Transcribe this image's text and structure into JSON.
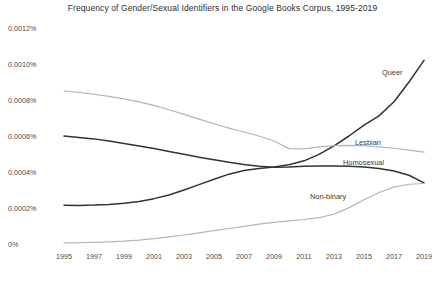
{
  "chart_data": {
    "type": "line",
    "title": "Frequency of Gender/Sexual Identifiers in the Google Books Corpus, 1995-2019",
    "xlabel": "",
    "ylabel": "",
    "grid": false,
    "legend_position": "inline-right",
    "x": [
      1995,
      1996,
      1997,
      1998,
      1999,
      2000,
      2001,
      2002,
      2003,
      2004,
      2005,
      2006,
      2007,
      2008,
      2009,
      2010,
      2011,
      2012,
      2013,
      2014,
      2015,
      2016,
      2017,
      2018,
      2019
    ],
    "xticks": [
      "1995",
      "1997",
      "1999",
      "2001",
      "2003",
      "2005",
      "2007",
      "2009",
      "2011",
      "2013",
      "2015",
      "2017",
      "2019"
    ],
    "xtick_values": [
      1995,
      1997,
      1999,
      2001,
      2003,
      2005,
      2007,
      2009,
      2011,
      2013,
      2015,
      2017,
      2019
    ],
    "yticks": [
      "0%",
      "0.0002%",
      "0.0004%",
      "0.0006%",
      "0.0008%",
      "0.0010%",
      "0.0012%"
    ],
    "ytick_values": [
      0,
      0.0002,
      0.0004,
      0.0006,
      0.0008,
      0.001,
      0.0012
    ],
    "ylim": [
      0,
      0.0012
    ],
    "xlim": [
      1995,
      2019
    ],
    "series": [
      {
        "name": "Queer",
        "color": "#333333",
        "width": 1.5,
        "label_x": 2016.2,
        "label_y": 0.00094,
        "values": [
          0.000215,
          0.000214,
          0.000216,
          0.00022,
          0.000226,
          0.000236,
          0.000252,
          0.000272,
          0.0003,
          0.00033,
          0.00036,
          0.000388,
          0.000408,
          0.00042,
          0.000428,
          0.00044,
          0.000462,
          0.000498,
          0.000545,
          0.0006,
          0.00066,
          0.000712,
          0.00079,
          0.0009,
          0.00102
        ]
      },
      {
        "name": "Lesbian",
        "color": "#b5b5b5",
        "width": 1.2,
        "label_x": 2014.4,
        "label_y": 0.000548,
        "values": [
          0.00085,
          0.000842,
          0.000832,
          0.00082,
          0.000806,
          0.00079,
          0.00077,
          0.000746,
          0.00072,
          0.000694,
          0.000668,
          0.000644,
          0.000622,
          0.0006,
          0.000572,
          0.00053,
          0.000528,
          0.00054,
          0.000546,
          0.000548,
          0.000546,
          0.00054,
          0.000532,
          0.000522,
          0.00051
        ]
      },
      {
        "name": "Homosexual",
        "color": "#333333",
        "width": 1.5,
        "label_x": 2013.6,
        "label_y": 0.00044,
        "values": [
          0.0006,
          0.000592,
          0.000584,
          0.000572,
          0.000558,
          0.000544,
          0.00053,
          0.000514,
          0.000498,
          0.000482,
          0.000468,
          0.000454,
          0.000442,
          0.000432,
          0.000426,
          0.000428,
          0.000432,
          0.000434,
          0.000434,
          0.000432,
          0.000428,
          0.00042,
          0.000406,
          0.000382,
          0.00034
        ]
      },
      {
        "name": "Non-binary",
        "color": "#b5b5b5",
        "width": 1.2,
        "label_x": 2011.4,
        "label_y": 0.000252,
        "values": [
          6e-06,
          7e-06,
          9e-06,
          1.2e-05,
          1.6e-05,
          2.2e-05,
          3e-05,
          4e-05,
          5e-05,
          6.2e-05,
          7.4e-05,
          8.6e-05,
          9.8e-05,
          0.00011,
          0.00012,
          0.000128,
          0.000136,
          0.000146,
          0.000166,
          0.000202,
          0.000246,
          0.000286,
          0.000316,
          0.000332,
          0.000336
        ]
      }
    ]
  }
}
